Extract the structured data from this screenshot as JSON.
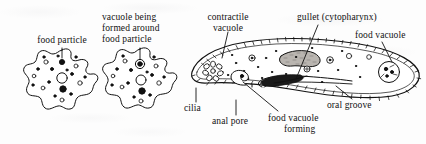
{
  "figure": {
    "background_color": "#fdfdfd",
    "ink_color": "#111111",
    "width": 426,
    "height": 144
  },
  "panels": {
    "amoeba_stage_one": {
      "name": "Amoeba engulfing a food particle",
      "label": "food particle"
    },
    "amoeba_stage_two": {
      "name": "Amoeba with forming food vacuole",
      "label_line_1": "vacuole being",
      "label_line_2": "formed around",
      "label_line_3": "food particle"
    },
    "paramecium": {
      "name": "Paramecium internal structure",
      "labels": {
        "contractile_vacuole_line_1": "contractile",
        "contractile_vacuole_line_2": "vacuole",
        "gullet": "gullet (cytopharynx)",
        "food_vacuole": "food vacuole",
        "cilia": "cilia",
        "anal_pore": "anal pore",
        "food_vacuole_forming_line_1": "food vacuole",
        "food_vacuole_forming_line_2": "forming",
        "oral_groove": "oral groove"
      }
    }
  }
}
